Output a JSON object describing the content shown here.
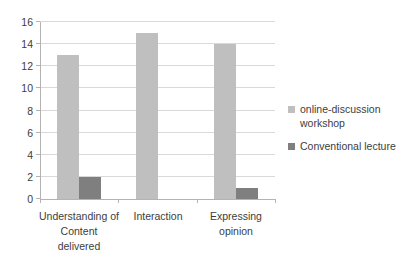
{
  "chart_data": {
    "type": "bar",
    "ylim": [
      0,
      16
    ],
    "ytick_step": 2,
    "yticks": [
      0,
      2,
      4,
      6,
      8,
      10,
      12,
      14,
      16
    ],
    "grid": true,
    "legend_position": "right",
    "categories": [
      {
        "label": "Understanding of Content delivered",
        "lines": [
          "Understanding of",
          "Content",
          "delivered"
        ]
      },
      {
        "label": "Interaction",
        "lines": [
          "Interaction"
        ]
      },
      {
        "label": "Expressing opinion",
        "lines": [
          "Expressing",
          "opinion"
        ]
      }
    ],
    "series": [
      {
        "name": "online-discussion workshop",
        "legend_lines": [
          "online-discussion",
          "workshop"
        ],
        "color": "#bfbfbf",
        "values": [
          13,
          15,
          14
        ]
      },
      {
        "name": "Conventional lecture",
        "legend_lines": [
          "Conventional lecture"
        ],
        "color": "#7f7f7f",
        "values": [
          2,
          0,
          1
        ]
      }
    ]
  },
  "colors": {
    "background": "#ffffff",
    "gridline": "#d9d9d9",
    "axis": "#b3b3b3",
    "text": "#3d3d3d",
    "series_online_discussion_workshop": "#bfbfbf",
    "series_conventional_lecture": "#7f7f7f"
  }
}
